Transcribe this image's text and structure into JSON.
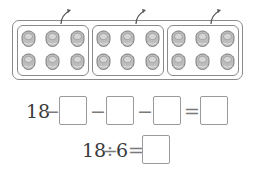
{
  "figure": {
    "total_objects": 18,
    "groups": [
      {
        "label": "group-1",
        "rows": 2,
        "cols": 3,
        "count": 6
      },
      {
        "label": "group-2",
        "rows": 2,
        "cols": 3,
        "count": 6
      },
      {
        "label": "group-3",
        "rows": 2,
        "cols": 3,
        "count": 6
      }
    ],
    "object_icon": "round-candy-icon",
    "arrow_icon": "curved-arrow-up-icon",
    "colors": {
      "object_fill": "#bdbdbd",
      "object_stroke": "#6e6e6e",
      "border": "#8a8a8a"
    }
  },
  "equation1": {
    "start": "18",
    "op1": "−",
    "op2": "−",
    "op3": "−",
    "equals": "=",
    "blanks": [
      "",
      "",
      "",
      ""
    ]
  },
  "equation2": {
    "expr": "18 ÷ 6",
    "left": "18",
    "div": "÷",
    "right": "6",
    "equals": "=",
    "blank": ""
  }
}
